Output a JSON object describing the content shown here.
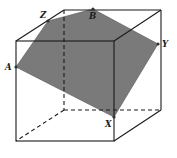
{
  "diagram": {
    "type": "cube-cross-section",
    "colors": {
      "edge": "#1a1a1a",
      "section_fill": "#7a7a7a",
      "background": "#ffffff"
    },
    "cube": {
      "front_face": [
        [
          16,
          41
        ],
        [
          114,
          41
        ],
        [
          114,
          141
        ],
        [
          16,
          141
        ]
      ],
      "back_face": [
        [
          64,
          10
        ],
        [
          161,
          10
        ],
        [
          161,
          110
        ],
        [
          64,
          110
        ]
      ]
    },
    "section_polygon": [
      [
        16,
        67
      ],
      [
        48,
        21
      ],
      [
        93,
        9
      ],
      [
        158,
        44
      ],
      [
        114,
        117
      ]
    ],
    "points": [
      {
        "name": "A",
        "x": 16,
        "y": 67,
        "label_x": 5,
        "label_y": 70
      },
      {
        "name": "Z",
        "x": 48,
        "y": 21,
        "label_x": 40,
        "label_y": 18
      },
      {
        "name": "B",
        "x": 93,
        "y": 9,
        "label_x": 89,
        "label_y": 19
      },
      {
        "name": "Y",
        "x": 158,
        "y": 44,
        "label_x": 162,
        "label_y": 47
      },
      {
        "name": "X",
        "x": 114,
        "y": 117,
        "label_x": 105,
        "label_y": 127
      }
    ],
    "labels": {
      "A": "A",
      "Z": "Z",
      "B": "B",
      "Y": "Y",
      "X": "X"
    }
  }
}
